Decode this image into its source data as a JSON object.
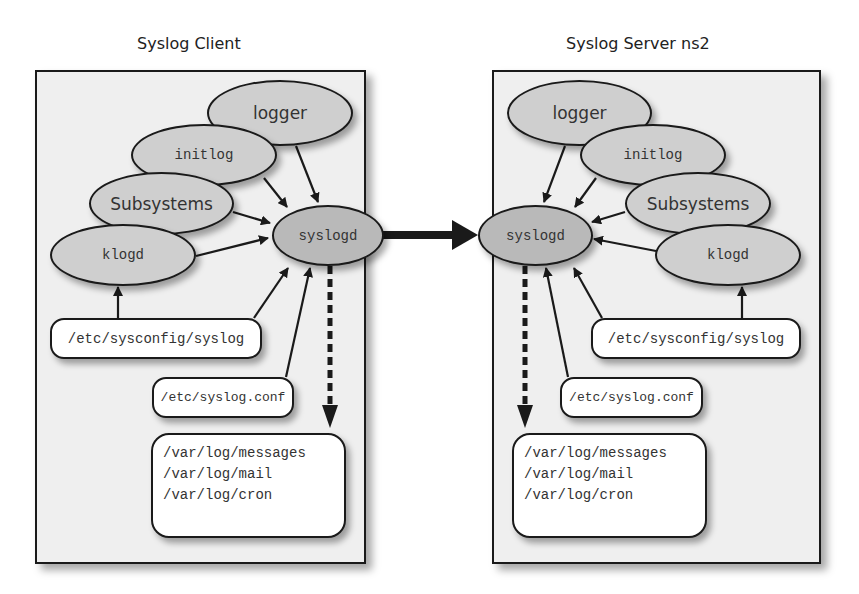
{
  "client": {
    "title": "Syslog Client",
    "nodes": {
      "logger": "logger",
      "initlog": "initlog",
      "subsystems": "Subsystems",
      "klogd": "klogd",
      "syslogd": "syslogd"
    },
    "files": {
      "sysconfig": "/etc/sysconfig/syslog",
      "syslog_conf": "/etc/syslog.conf",
      "logs": [
        "/var/log/messages",
        "/var/log/mail",
        "/var/log/cron"
      ]
    }
  },
  "server": {
    "title": "Syslog Server ns2",
    "nodes": {
      "logger": "logger",
      "initlog": "initlog",
      "subsystems": "Subsystems",
      "klogd": "klogd",
      "syslogd": "syslogd"
    },
    "files": {
      "sysconfig": "/etc/sysconfig/syslog",
      "syslog_conf": "/etc/syslog.conf",
      "logs": [
        "/var/log/messages",
        "/var/log/mail",
        "/var/log/cron"
      ]
    }
  },
  "colors": {
    "panel_bg": "#efefef",
    "node_fill": "#cfcfcf",
    "core_fill": "#b9b9b9",
    "stroke": "#1a1a1a",
    "file_fill": "#ffffff"
  }
}
